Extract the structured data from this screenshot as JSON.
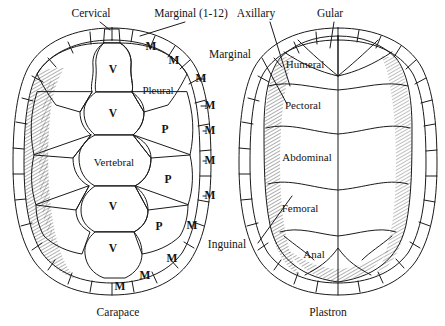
{
  "figure": {
    "ink_color": "#1a1a1a",
    "background_color": "#ffffff"
  },
  "captions": [
    {
      "text": "Carapace",
      "x": 118,
      "y": 313
    },
    {
      "text": "Plastron",
      "x": 328,
      "y": 313
    }
  ],
  "carapace": {
    "callouts": [
      {
        "name": "cervical",
        "text": "Cervical",
        "x": 91,
        "y": 14
      },
      {
        "name": "marginal-range",
        "text": "Marginal  (1-12)",
        "x": 191,
        "y": 14
      }
    ],
    "scutes": [
      {
        "name": "vertebral-1",
        "text": "V",
        "x": 113,
        "y": 70
      },
      {
        "name": "vertebral-2",
        "text": "V",
        "x": 113,
        "y": 114
      },
      {
        "name": "vertebral-3",
        "text": "Vertebral",
        "x": 114,
        "y": 162
      },
      {
        "name": "vertebral-4",
        "text": "V",
        "x": 113,
        "y": 207
      },
      {
        "name": "vertebral-5",
        "text": "V",
        "x": 113,
        "y": 249
      },
      {
        "name": "pleural-1",
        "text": "Pleural",
        "x": 158,
        "y": 90
      },
      {
        "name": "pleural-2",
        "text": "P",
        "x": 165,
        "y": 130
      },
      {
        "name": "pleural-3",
        "text": "P",
        "x": 168,
        "y": 180
      },
      {
        "name": "pleural-4",
        "text": "P",
        "x": 159,
        "y": 227
      }
    ],
    "marginals": [
      {
        "name": "marginal-m1",
        "text": "M",
        "x": 151,
        "y": 47
      },
      {
        "name": "marginal-m2",
        "text": "M",
        "x": 174,
        "y": 61
      },
      {
        "name": "marginal-m3",
        "text": "M",
        "x": 201,
        "y": 79
      },
      {
        "name": "marginal-m4",
        "text": "M",
        "x": 210,
        "y": 106
      },
      {
        "name": "marginal-m5",
        "text": "M",
        "x": 210,
        "y": 131
      },
      {
        "name": "marginal-m6",
        "text": "M",
        "x": 210,
        "y": 161
      },
      {
        "name": "marginal-m7",
        "text": "M",
        "x": 210,
        "y": 196
      },
      {
        "name": "marginal-m8",
        "text": "M",
        "x": 192,
        "y": 226
      },
      {
        "name": "marginal-m9",
        "text": "M",
        "x": 172,
        "y": 259
      },
      {
        "name": "marginal-m10",
        "text": "M",
        "x": 145,
        "y": 276
      },
      {
        "name": "marginal-m11",
        "text": "M",
        "x": 120,
        "y": 287
      }
    ]
  },
  "plastron": {
    "callouts": [
      {
        "name": "axillary",
        "text": "Axillary",
        "x": 256,
        "y": 14
      },
      {
        "name": "gular",
        "text": "Gular",
        "x": 330,
        "y": 14
      },
      {
        "name": "marginal",
        "text": "Marginal",
        "x": 230,
        "y": 55
      },
      {
        "name": "inguinal",
        "text": "Inguinal",
        "x": 227,
        "y": 245
      }
    ],
    "scutes": [
      {
        "name": "humeral",
        "text": "Humeral",
        "x": 305,
        "y": 64
      },
      {
        "name": "pectoral",
        "text": "Pectoral",
        "x": 303,
        "y": 105
      },
      {
        "name": "abdominal",
        "text": "Abdominal",
        "x": 307,
        "y": 157
      },
      {
        "name": "femoral",
        "text": "Femoral",
        "x": 300,
        "y": 208
      },
      {
        "name": "anal",
        "text": "Anal",
        "x": 314,
        "y": 254
      }
    ]
  }
}
